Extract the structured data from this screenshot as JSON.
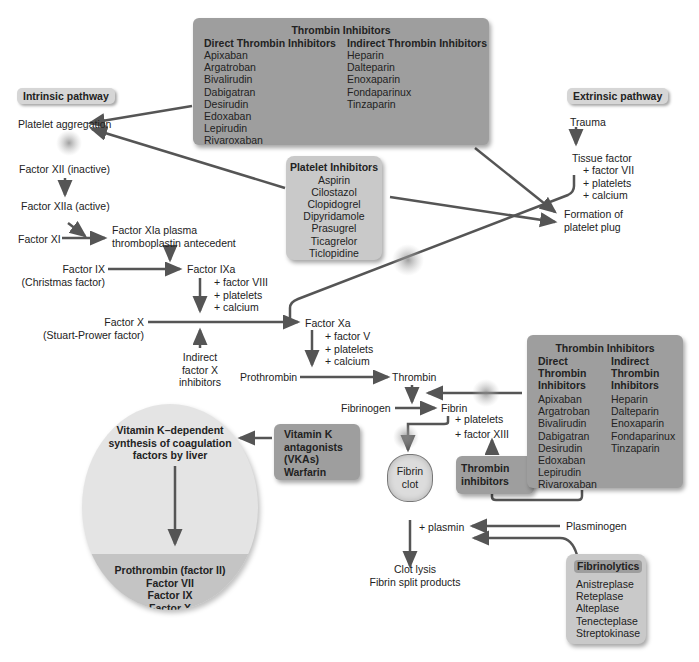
{
  "pathways": {
    "intrinsic": "Intrinsic pathway",
    "extrinsic": "Extrinsic pathway"
  },
  "intrinsic_steps": {
    "platelet_aggregation": "Platelet aggregation",
    "factor_xii": "Factor XII (inactive)",
    "factor_xiia": "Factor XIIa (active)",
    "factor_xi": "Factor XI",
    "factor_xia_line1": "Factor XIa plasma",
    "factor_xia_line2": "thromboplastin antecedent",
    "factor_ix": "Factor IX",
    "factor_ix_alt": "(Christmas factor)",
    "factor_ixa": "Factor IXa",
    "factor_ixa_adds": [
      "+ factor VIII",
      "+ platelets",
      "+ calcium"
    ],
    "factor_x": "Factor X",
    "factor_x_alt": "(Stuart-Prower factor)",
    "indirect_fx_inhibitors": [
      "Indirect",
      "factor X",
      "inhibitors"
    ]
  },
  "common_steps": {
    "factor_xa": "Factor Xa",
    "factor_xa_adds": [
      "+ factor V",
      "+ platelets",
      "+ calcium"
    ],
    "prothrombin": "Prothrombin",
    "thrombin": "Thrombin",
    "fibrinogen": "Fibrinogen",
    "fibrin": "Fibrin",
    "fibrin_adds": [
      "+ platelets",
      "+ factor XIII"
    ],
    "fibrin_clot": [
      "Fibrin",
      "clot"
    ],
    "plasmin": "+ plasmin",
    "plasminogen": "Plasminogen",
    "clot_lysis": [
      "Clot lysis",
      "Fibrin split products"
    ]
  },
  "extrinsic_steps": {
    "trauma": "Trauma",
    "tissue_factor": "Tissue factor",
    "tissue_factor_adds": [
      "+ factor VII",
      "+ platelets",
      "+ calcium"
    ],
    "platelet_plug": [
      "Formation of",
      "platelet plug"
    ]
  },
  "thrombin_inhibitors_top": {
    "title": "Thrombin Inhibitors",
    "direct_header": "Direct Thrombin Inhibitors",
    "indirect_header": "Indirect Thrombin Inhibitors",
    "direct": [
      "Apixaban",
      "Argatroban",
      "Bivalirudin",
      "Dabigatran",
      "Desirudin",
      "Edoxaban",
      "Lepirudin",
      "Rivaroxaban"
    ],
    "indirect": [
      "Heparin",
      "Dalteparin",
      "Enoxaparin",
      "Fondaparinux",
      "Tinzaparin"
    ]
  },
  "platelet_inhibitors": {
    "title": "Platelet Inhibitors",
    "items": [
      "Aspirin",
      "Cilostazol",
      "Clopidogrel",
      "Dipyridamole",
      "Prasugrel",
      "Ticagrelor",
      "Ticlopidine"
    ]
  },
  "thrombin_inhibitors_right": {
    "title": "Thrombin Inhibitors",
    "direct_header": [
      "Direct",
      "Thrombin",
      "Inhibitors"
    ],
    "indirect_header": [
      "Indirect",
      "Thrombin",
      "Inhibitors"
    ],
    "direct": [
      "Apixaban",
      "Argatroban",
      "Bivalirudin",
      "Dabigatran",
      "Desirudin",
      "Edoxaban",
      "Lepirudin",
      "Rivaroxaban"
    ],
    "indirect": [
      "Heparin",
      "Dalteparin",
      "Enoxaparin",
      "Fondaparinux",
      "Tinzaparin"
    ]
  },
  "thrombin_inhibitors_small": [
    "Thrombin",
    "inhibitors"
  ],
  "vka_box": [
    "Vitamin K",
    "antagonists",
    "(VKAs)",
    "Warfarin"
  ],
  "liver": {
    "title": [
      "Vitamin K–dependent",
      "synthesis of coagulation",
      "factors by liver"
    ],
    "factors": [
      "Prothrombin (factor II)",
      "Factor VII",
      "Factor IX",
      "Factor X"
    ]
  },
  "fibrinolytics": {
    "title": "Fibrinolytics",
    "items": [
      "Anistreplase",
      "Reteplase",
      "Alteplase",
      "Tenecteplase",
      "Streptokinase"
    ]
  },
  "colors": {
    "box_dark": "#9e9e9e",
    "box_light": "#c9c9c9",
    "arrow": "#555555",
    "liver_top": "#e4e4e4",
    "liver_bottom": "#c4c4c4"
  }
}
